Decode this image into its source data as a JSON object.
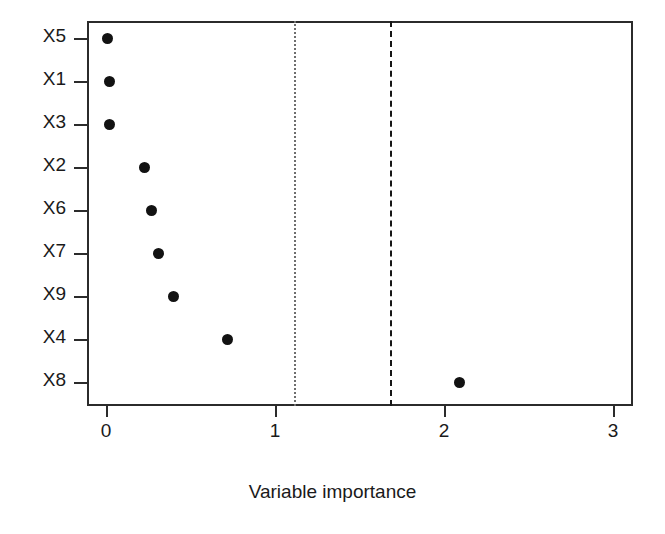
{
  "chart_data": {
    "type": "scatter",
    "title": "",
    "xlabel": "Variable importance",
    "ylabel": "",
    "xlim": [
      -0.13,
      3.12
    ],
    "ylim_categories_order_top_to_bottom": [
      "X5",
      "X1",
      "X3",
      "X2",
      "X6",
      "X7",
      "X9",
      "X4",
      "X8"
    ],
    "categories": [
      "X5",
      "X1",
      "X3",
      "X2",
      "X6",
      "X7",
      "X9",
      "X4",
      "X8"
    ],
    "values": [
      0.01,
      0.02,
      0.02,
      0.23,
      0.27,
      0.31,
      0.4,
      0.72,
      2.09
    ],
    "points": [
      {
        "label": "X5",
        "value": 0.01
      },
      {
        "label": "X1",
        "value": 0.02
      },
      {
        "label": "X3",
        "value": 0.02
      },
      {
        "label": "X2",
        "value": 0.23
      },
      {
        "label": "X6",
        "value": 0.27
      },
      {
        "label": "X7",
        "value": 0.31
      },
      {
        "label": "X9",
        "value": 0.4
      },
      {
        "label": "X4",
        "value": 0.72
      },
      {
        "label": "X8",
        "value": 2.09
      }
    ],
    "x_ticks": [
      0,
      1,
      2,
      3
    ],
    "x_tick_labels": [
      "0",
      "1",
      "2",
      "3"
    ],
    "y_tick_labels": [
      "X5",
      "X1",
      "X3",
      "X2",
      "X6",
      "X7",
      "X9",
      "X4",
      "X8"
    ],
    "reference_lines": [
      {
        "name": "threshold-dotted",
        "value": 1.11,
        "style": "dotted",
        "color": "#6e6e6e"
      },
      {
        "name": "threshold-dashed",
        "value": 1.68,
        "style": "dashed",
        "color": "#161616"
      }
    ],
    "grid": false,
    "legend": null,
    "marker": {
      "shape": "circle",
      "color": "#121212",
      "size_px": 11
    },
    "frame_color": "#2b2b2b",
    "background": "#ffffff"
  }
}
